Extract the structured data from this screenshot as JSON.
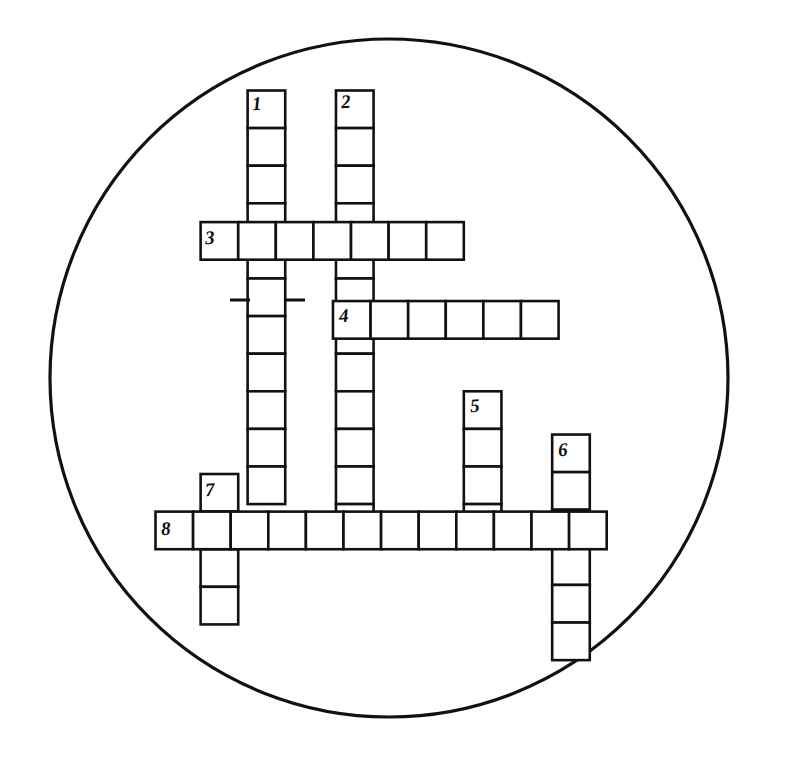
{
  "page": {
    "background_color": "#ffffff",
    "ink_color": "#111111",
    "width": 785,
    "height": 770
  },
  "circle": {
    "name": "puzzle-boundary-circle",
    "center_x": 389,
    "center_y": 378,
    "radius": 339,
    "stroke_width": 3.2
  },
  "grid": {
    "cell_size": 37.6,
    "origin_x": 155.5,
    "origin_y": 90.5,
    "stroke_width": 2.6,
    "entries": [
      {
        "number": "1",
        "direction": "down",
        "col": 2.45,
        "row": 0,
        "length": 11,
        "label_x": 252,
        "label_y": 94
      },
      {
        "number": "2",
        "direction": "down",
        "col": 4.8,
        "row": 0,
        "length": 12,
        "label_x": 341,
        "label_y": 92
      },
      {
        "number": "3",
        "direction": "across",
        "col": 1.2,
        "row": 3.5,
        "length": 7,
        "label_x": 205,
        "label_y": 228
      },
      {
        "number": "4",
        "direction": "across",
        "col": 4.72,
        "row": 5.6,
        "length": 6,
        "label_x": 339,
        "label_y": 306
      },
      {
        "number": "5",
        "direction": "down",
        "col": 8.2,
        "row": 8.0,
        "length": 4,
        "label_x": 470,
        "label_y": 396
      },
      {
        "number": "6",
        "direction": "down",
        "col": 10.55,
        "row": 9.15,
        "length": 6,
        "label_x": 558,
        "label_y": 440
      },
      {
        "number": "7",
        "direction": "down",
        "col": 1.2,
        "row": 10.2,
        "length": 4,
        "label_x": 205,
        "label_y": 480
      },
      {
        "number": "8",
        "direction": "across",
        "col": 0.0,
        "row": 11.2,
        "length": 12,
        "label_x": 161,
        "label_y": 519
      }
    ],
    "tick_marks": [
      {
        "name": "tick-left-col1",
        "x1": 230,
        "y1": 300,
        "x2": 250,
        "y2": 300
      },
      {
        "name": "tick-right-col1",
        "x1": 285,
        "y1": 300,
        "x2": 305,
        "y2": 300
      }
    ]
  },
  "clue_numbers": [
    "1",
    "2",
    "3",
    "4",
    "5",
    "6",
    "7",
    "8"
  ]
}
